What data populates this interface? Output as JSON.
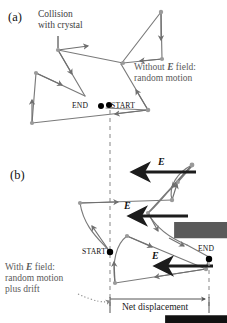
{
  "figure": {
    "colors": {
      "path": "#7a7a7a",
      "path_dark": "#6b6b6b",
      "node": "#9a9a9a",
      "dashed": "#9a9a9a",
      "efield_arrow": "#1c1c1c",
      "endpoint_dot": "#000000",
      "text": "#1a1a1a",
      "note_gray": "#5a5a5a",
      "background": "#ffffff"
    }
  },
  "panel_a": {
    "tag": "(a)",
    "collision_label_line1": "Collision",
    "collision_label_line2": "with crystal",
    "note_line1_prefix": "Without ",
    "note_line1_vector": "E",
    "note_line1_suffix": " field:",
    "note_line2": "random motion",
    "start_label": "START",
    "end_label": "END",
    "path_vertices": [
      [
        148,
        110
      ],
      [
        121,
        64
      ],
      [
        161,
        12
      ],
      [
        162,
        59
      ],
      [
        123,
        63
      ],
      [
        58,
        50
      ],
      [
        85,
        96
      ],
      [
        36,
        73
      ],
      [
        32,
        123
      ],
      [
        148,
        110
      ],
      [
        106,
        108
      ]
    ],
    "arrow_count": 8
  },
  "panel_b": {
    "tag": "(b)",
    "note_line1_prefix": "With ",
    "note_line1_vector": "E",
    "note_line1_suffix": " field:",
    "note_line2": "random motion",
    "note_line3": "plus drift",
    "start_label": "START",
    "end_label": "END",
    "net_displacement_label": "Net displacement",
    "efield_label": "E",
    "efield_arrow_count": 3,
    "efield_arrows": [
      {
        "x_tail": 196,
        "x_head": 132,
        "y": 172
      },
      {
        "x_tail": 188,
        "x_head": 129,
        "y": 216
      },
      {
        "x_tail": 213,
        "x_head": 155,
        "y": 266
      }
    ],
    "start_point": [
      110,
      252
    ],
    "end_point": [
      209,
      260
    ],
    "net_displacement_from_x": 110,
    "net_displacement_to_x": 209,
    "net_displacement_y": 305
  }
}
